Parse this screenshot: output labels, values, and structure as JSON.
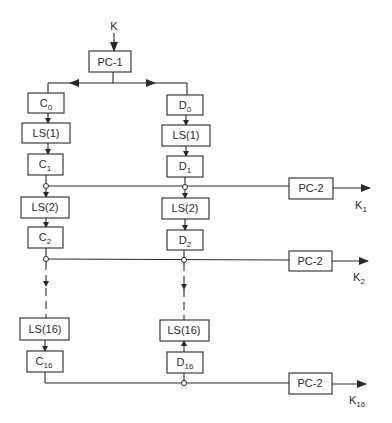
{
  "diagram": {
    "input_label": "K",
    "pc1": "PC-1",
    "left": {
      "c0": {
        "base": "C",
        "sub": "0"
      },
      "ls1": "LS(1)",
      "c1": {
        "base": "C",
        "sub": "1"
      },
      "ls2": "LS(2)",
      "c2": {
        "base": "C",
        "sub": "2"
      },
      "ls16": "LS(16)",
      "c16": {
        "base": "C",
        "sub": "16"
      }
    },
    "right": {
      "d0": {
        "base": "D",
        "sub": "0"
      },
      "ls1": "LS(1)",
      "d1": {
        "base": "D",
        "sub": "1"
      },
      "ls2": "LS(2)",
      "d2": {
        "base": "D",
        "sub": "2"
      },
      "ls16": "LS(16)",
      "d16": {
        "base": "D",
        "sub": "16"
      }
    },
    "pc2": [
      "PC-2",
      "PC-2",
      "PC-2"
    ],
    "outputs": [
      {
        "base": "K",
        "sub": "1"
      },
      {
        "base": "K",
        "sub": "2"
      },
      {
        "base": "K",
        "sub": "16"
      }
    ]
  }
}
